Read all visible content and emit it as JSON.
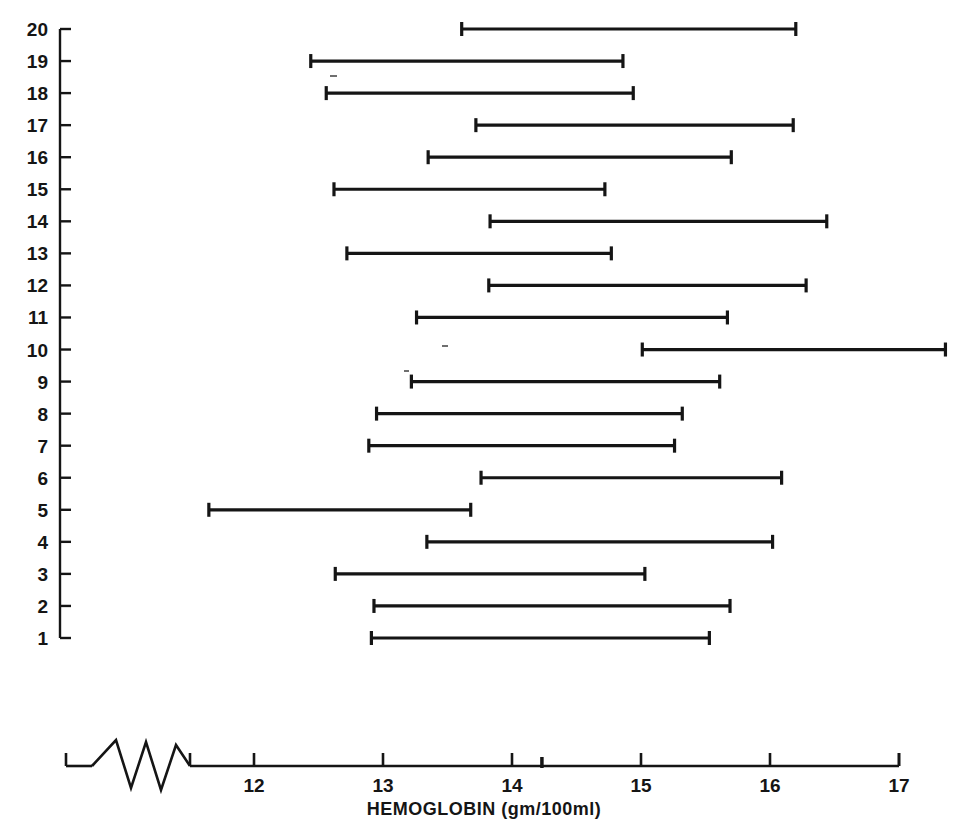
{
  "figure": {
    "kind": "range-interval-plot",
    "background": "#ffffff",
    "ink_color": "#151515"
  },
  "axes": {
    "x_title": "HEMOGLOBIN (gm/100ml)",
    "x_ticks": [
      "12",
      "13",
      "14",
      "15",
      "16",
      "17"
    ],
    "x_tick_values": [
      12,
      13,
      14,
      15,
      16,
      17
    ],
    "x_axis_break": true,
    "x_break_symbol": "zigzag",
    "y_title": "",
    "y_ticks": [
      "20",
      "19",
      "18",
      "17",
      "16",
      "15",
      "14",
      "13",
      "12",
      "11",
      "10",
      "9",
      "8",
      "7",
      "6",
      "5",
      "4",
      "3",
      "2",
      "1"
    ]
  },
  "chart_data": {
    "type": "bar",
    "title": "",
    "subtitle": "",
    "xlabel": "HEMOGLOBIN (gm/100ml)",
    "ylabel": "",
    "xlim": [
      11.45,
      17.45
    ],
    "ylim": [
      0.5,
      20.5
    ],
    "grid": false,
    "legend": null,
    "orientation": "horizontal",
    "note": "Each row is a subject; each horizontal bar spans that subject's minimum to maximum hemoglobin value (gm/100ml).",
    "categories": [
      "1",
      "2",
      "3",
      "4",
      "5",
      "6",
      "7",
      "8",
      "9",
      "10",
      "11",
      "12",
      "13",
      "14",
      "15",
      "16",
      "17",
      "18",
      "19",
      "20"
    ],
    "series": [
      {
        "name": "low",
        "values": [
          12.91,
          12.93,
          12.63,
          13.34,
          11.65,
          13.76,
          12.89,
          12.95,
          13.22,
          15.01,
          13.26,
          13.82,
          12.72,
          13.83,
          12.62,
          13.35,
          13.72,
          12.56,
          12.44,
          13.61
        ]
      },
      {
        "name": "high",
        "values": [
          15.53,
          15.69,
          15.03,
          16.02,
          13.68,
          16.09,
          15.26,
          15.32,
          15.61,
          17.36,
          15.67,
          16.28,
          14.77,
          16.44,
          14.72,
          15.7,
          16.18,
          14.94,
          14.86,
          16.2
        ]
      }
    ],
    "intervals": [
      {
        "row": 20,
        "low": 13.61,
        "high": 16.2
      },
      {
        "row": 19,
        "low": 12.44,
        "high": 14.86
      },
      {
        "row": 18,
        "low": 12.56,
        "high": 14.94
      },
      {
        "row": 17,
        "low": 13.72,
        "high": 16.18
      },
      {
        "row": 16,
        "low": 13.35,
        "high": 15.7
      },
      {
        "row": 15,
        "low": 12.62,
        "high": 14.72
      },
      {
        "row": 14,
        "low": 13.83,
        "high": 16.44
      },
      {
        "row": 13,
        "low": 12.72,
        "high": 14.77
      },
      {
        "row": 12,
        "low": 13.82,
        "high": 16.28
      },
      {
        "row": 11,
        "low": 13.26,
        "high": 15.67
      },
      {
        "row": 10,
        "low": 15.01,
        "high": 17.36
      },
      {
        "row": 9,
        "low": 13.22,
        "high": 15.61
      },
      {
        "row": 8,
        "low": 12.95,
        "high": 15.32
      },
      {
        "row": 7,
        "low": 12.89,
        "high": 15.26
      },
      {
        "row": 6,
        "low": 13.76,
        "high": 16.09
      },
      {
        "row": 5,
        "low": 11.65,
        "high": 13.68
      },
      {
        "row": 4,
        "low": 13.34,
        "high": 16.02
      },
      {
        "row": 3,
        "low": 12.63,
        "high": 15.03
      },
      {
        "row": 2,
        "low": 12.93,
        "high": 15.69
      },
      {
        "row": 1,
        "low": 12.91,
        "high": 15.53
      }
    ]
  }
}
